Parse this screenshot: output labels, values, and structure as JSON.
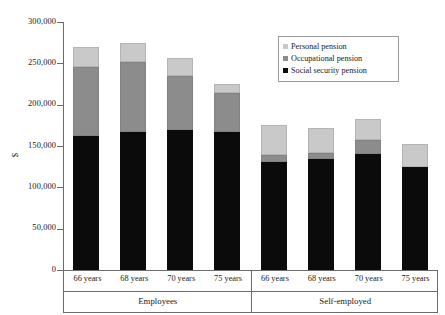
{
  "chart_data": {
    "type": "bar",
    "stacked": true,
    "title": "",
    "xlabel": "",
    "ylabel": "$",
    "ylim": [
      0,
      300000
    ],
    "ytick_values": [
      0,
      50000,
      100000,
      150000,
      200000,
      250000,
      300000
    ],
    "ytick_labels": [
      "0",
      "50,000",
      "100,000",
      "150,000",
      "200,000",
      "250,000",
      "300,000"
    ],
    "grid": false,
    "legend_position": "top-right",
    "groups": [
      "Employees",
      "Self-employed"
    ],
    "categories": [
      "66 years",
      "68 years",
      "70 years",
      "75 years",
      "66 years",
      "68 years",
      "70 years",
      "75 years"
    ],
    "series": [
      {
        "name": "Social security pension",
        "color": "#0b0b0b",
        "values": [
          162000,
          167000,
          169000,
          167000,
          131000,
          134000,
          140000,
          125000
        ]
      },
      {
        "name": "Occupational pension",
        "color": "#8c8c8c",
        "values": [
          84000,
          85000,
          66000,
          47000,
          8000,
          7000,
          17000,
          0
        ]
      },
      {
        "name": "Personal pension",
        "color": "#c9c9c9",
        "values": [
          24000,
          23000,
          22000,
          11000,
          37000,
          31000,
          26000,
          27000
        ]
      }
    ],
    "totals": [
      270000,
      275000,
      257000,
      225000,
      176000,
      172000,
      183000,
      152000
    ]
  },
  "legend": {
    "items": [
      {
        "label": "Personal pension",
        "icon": "square-swatch-light-gray"
      },
      {
        "label": "Occupational pension",
        "icon": "square-swatch-medium-gray"
      },
      {
        "label": "Social security pension",
        "icon": "square-swatch-black"
      }
    ]
  },
  "axes": {
    "y_title": "$"
  }
}
